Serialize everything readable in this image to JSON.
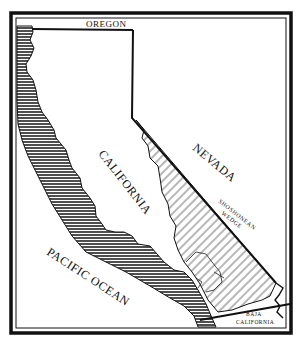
{
  "map": {
    "title": "",
    "labels": {
      "oregon": "OREGON",
      "nevada": "NEVADA",
      "california": "CALIFORNIA",
      "pacific_ocean": "PACIFIC OCEAN",
      "shoshonean_line1": "SHOSHONEAN",
      "shoshonean_line2": "WEDGE",
      "baja_line1": "BAJA",
      "baja_line2": "CALIFORNIA"
    },
    "regions": [
      {
        "name": "coastal-strip",
        "fill": "horizontal-hatch",
        "description": "Dense horizontal hatching along the Pacific coast"
      },
      {
        "name": "shoshonean-wedge",
        "fill": "diagonal-hatch",
        "description": "Diagonal hatching in eastern California"
      }
    ],
    "colors": {
      "ink": "#111111",
      "background": "#ffffff"
    }
  }
}
